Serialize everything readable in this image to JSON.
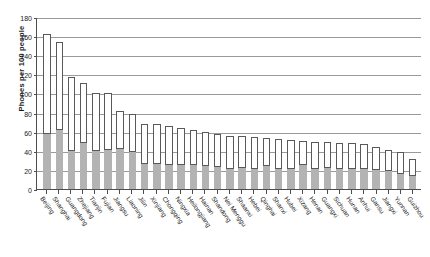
{
  "chart_data": {
    "type": "bar",
    "title": "",
    "subtitle": "",
    "xlabel": "",
    "ylabel": "Phones per 100 people",
    "ylim": [
      0,
      180
    ],
    "ytick_step": 20,
    "yticks": [
      "0",
      "20",
      "40",
      "60",
      "80",
      "100",
      "120",
      "140",
      "160",
      "180"
    ],
    "grid": true,
    "grid_axis": "y",
    "legend_position": "none",
    "stacked": true,
    "categories": [
      "Beijing",
      "Shanghai",
      "Guangdong",
      "Zhejiang",
      "Tianjin",
      "Fujian",
      "Jiangsu",
      "Liaoning",
      "Jilin",
      "Xinjiang",
      "Chongqing",
      "Ningxia",
      "Heilongjiang",
      "Hainan",
      "Shandong",
      "Nei Menggu",
      "Shaanxi",
      "Hebei",
      "Qinghai",
      "Shanxi",
      "Hubei",
      "Xizang",
      "Henan",
      "Guangxi",
      "Sichuan",
      "Hunan",
      "Anhui",
      "Gansu",
      "Jiangxi",
      "Yunnan",
      "Guizhou"
    ],
    "series": [
      {
        "name": "lower-segment",
        "color": "#b3b3b3",
        "values": [
          59,
          63,
          41,
          49,
          41,
          42,
          43,
          40,
          27,
          27,
          26,
          26,
          26,
          25,
          24,
          22,
          23,
          22,
          25,
          22,
          22,
          26,
          22,
          23,
          22,
          22,
          22,
          21,
          20,
          17,
          15
        ]
      },
      {
        "name": "upper-segment",
        "color": "#ffffff",
        "values": [
          103,
          91,
          76,
          62,
          59,
          58,
          39,
          38,
          41,
          41,
          40,
          38,
          36,
          35,
          34,
          34,
          32,
          32,
          28,
          30,
          29,
          24,
          27,
          26,
          26,
          26,
          25,
          23,
          21,
          22,
          16
        ]
      }
    ],
    "totals": [
      162,
      154,
      117,
      111,
      100,
      100,
      82,
      78,
      68,
      68,
      66,
      64,
      62,
      60,
      58,
      56,
      55,
      54,
      53,
      52,
      51,
      50,
      49,
      49,
      48,
      48,
      47,
      44,
      41,
      39,
      31
    ]
  },
  "axis": {
    "y_title": "Phones per 100 people"
  }
}
